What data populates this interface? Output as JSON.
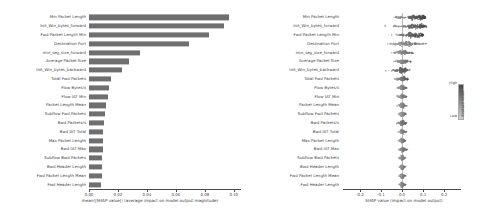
{
  "chart_data": [
    {
      "type": "bar",
      "panel": "left",
      "title": "",
      "xlabel": "mean(|SHAP value|) (average impact on model output magnitude)",
      "ylabel": "",
      "orientation": "horizontal",
      "xlim": [
        0.0,
        0.105
      ],
      "grid": false,
      "bar_color": "#6f6f6f",
      "xticks": [
        "0.00",
        "0.02",
        "0.04",
        "0.06",
        "0.08",
        "0.10"
      ],
      "xtick_values": [
        0.0,
        0.02,
        0.04,
        0.06,
        0.08,
        0.1
      ],
      "categories": [
        "Min Packet Length",
        "Init_Win_bytes_forward",
        "Fwd Packet Length Min",
        "Destination Port",
        "min_seg_size_forward",
        "Average Packet Size",
        "Init_Win_bytes_backward",
        "Total Fwd Packets",
        "Flow Bytes/s",
        "Flow IAT Min",
        "Packet Length Mean",
        "Subflow Fwd Packets",
        "Bwd Packets/s",
        "Bwd IAT Total",
        "Max Packet Length",
        "Bwd IAT Max",
        "Subflow Bwd Packets",
        "Bwd Header Length",
        "Fwd Packet Length Mean",
        "Fwd Header Length"
      ],
      "values": [
        0.0965,
        0.093,
        0.083,
        0.069,
        0.035,
        0.0275,
        0.023,
        0.015,
        0.0135,
        0.013,
        0.012,
        0.0112,
        0.0105,
        0.01,
        0.0098,
        0.0095,
        0.0092,
        0.009,
        0.0088,
        0.0085
      ]
    },
    {
      "type": "scatter",
      "panel": "right",
      "subtype": "beeswarm",
      "title": "",
      "xlabel": "SHAP value (impact on model output)",
      "ylabel": "",
      "xlim": [
        -0.28,
        0.28
      ],
      "grid": false,
      "xticks": [
        "-0.2",
        "-0.1",
        "0.0",
        "0.1",
        "0.2"
      ],
      "xtick_values": [
        -0.2,
        -0.1,
        0.0,
        0.1,
        0.2
      ],
      "categories": [
        "Min Packet Length",
        "Init_Win_bytes_forward",
        "Fwd Packet Length Min",
        "Destination Port",
        "min_seg_size_forward",
        "Average Packet Size",
        "Init_Win_bytes_backward",
        "Total Fwd Packets",
        "Flow Bytes/s",
        "Flow IAT Min",
        "Packet Length Mean",
        "Subflow Fwd Packets",
        "Bwd Packets/s",
        "Bwd IAT Total",
        "Max Packet Length",
        "Bwd IAT Max",
        "Subflow Bwd Packets",
        "Bwd Header Length",
        "Fwd Packet Length Mean",
        "Fwd Header Length"
      ],
      "row_spread": [
        {
          "feature": "Min Packet Length",
          "min": -0.2,
          "max": 0.115,
          "dense_from": 0.035,
          "dense_to": 0.105,
          "n": 120
        },
        {
          "feature": "Init_Win_bytes_forward",
          "min": -0.19,
          "max": 0.135,
          "dense_from": 0.03,
          "dense_to": 0.1,
          "n": 120
        },
        {
          "feature": "Fwd Packet Length Min",
          "min": -0.175,
          "max": 0.105,
          "dense_from": 0.03,
          "dense_to": 0.095,
          "n": 115
        },
        {
          "feature": "Destination Port",
          "min": -0.165,
          "max": 0.215,
          "dense_from": -0.01,
          "dense_to": 0.045,
          "n": 115
        },
        {
          "feature": "min_seg_size_forward",
          "min": -0.11,
          "max": 0.115,
          "dense_from": -0.012,
          "dense_to": 0.02,
          "n": 100
        },
        {
          "feature": "Average Packet Size",
          "min": -0.075,
          "max": 0.075,
          "dense_from": -0.012,
          "dense_to": 0.018,
          "n": 95
        },
        {
          "feature": "Init_Win_bytes_backward",
          "min": -0.215,
          "max": 0.065,
          "dense_from": -0.01,
          "dense_to": 0.015,
          "n": 95
        },
        {
          "feature": "Total Fwd Packets",
          "min": -0.08,
          "max": 0.05,
          "dense_from": -0.008,
          "dense_to": 0.012,
          "n": 85
        },
        {
          "feature": "Flow Bytes/s",
          "min": -0.045,
          "max": 0.042,
          "dense_from": -0.007,
          "dense_to": 0.01,
          "n": 80
        },
        {
          "feature": "Flow IAT Min",
          "min": -0.048,
          "max": 0.048,
          "dense_from": -0.007,
          "dense_to": 0.01,
          "n": 80
        },
        {
          "feature": "Packet Length Mean",
          "min": -0.04,
          "max": 0.04,
          "dense_from": -0.006,
          "dense_to": 0.009,
          "n": 78
        },
        {
          "feature": "Subflow Fwd Packets",
          "min": -0.038,
          "max": 0.05,
          "dense_from": -0.006,
          "dense_to": 0.009,
          "n": 78
        },
        {
          "feature": "Bwd Packets/s",
          "min": -0.07,
          "max": 0.045,
          "dense_from": -0.006,
          "dense_to": 0.009,
          "n": 78
        },
        {
          "feature": "Bwd IAT Total",
          "min": -0.035,
          "max": 0.038,
          "dense_from": -0.005,
          "dense_to": 0.008,
          "n": 75
        },
        {
          "feature": "Max Packet Length",
          "min": -0.03,
          "max": 0.03,
          "dense_from": -0.005,
          "dense_to": 0.008,
          "n": 75
        },
        {
          "feature": "Bwd IAT Max",
          "min": -0.042,
          "max": 0.04,
          "dense_from": -0.005,
          "dense_to": 0.008,
          "n": 75
        },
        {
          "feature": "Subflow Bwd Packets",
          "min": -0.032,
          "max": 0.035,
          "dense_from": -0.005,
          "dense_to": 0.007,
          "n": 72
        },
        {
          "feature": "Bwd Header Length",
          "min": -0.028,
          "max": 0.03,
          "dense_from": -0.004,
          "dense_to": 0.007,
          "n": 72
        },
        {
          "feature": "Fwd Packet Length Mean",
          "min": -0.03,
          "max": 0.032,
          "dense_from": -0.004,
          "dense_to": 0.007,
          "n": 70
        },
        {
          "feature": "Fwd Header Length",
          "min": -0.04,
          "max": 0.038,
          "dense_from": -0.004,
          "dense_to": 0.007,
          "n": 70
        }
      ],
      "colorbar": {
        "title": "Feature value",
        "high_label": "High",
        "low_label": "Low",
        "high_color": "#4a4a4a",
        "low_color": "#cfcfcf"
      }
    }
  ]
}
